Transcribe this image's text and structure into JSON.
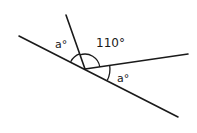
{
  "diagram": {
    "type": "angles-on-a-line",
    "labels": {
      "left_angle": "a°",
      "top_angle": "110°",
      "right_angle": "a°"
    },
    "colors": {
      "stroke": "#1a1a1a",
      "background": "#ffffff"
    },
    "geometry": {
      "vertex": [
        85,
        69
      ],
      "long_line": {
        "from": [
          19,
          36
        ],
        "to": [
          178,
          117
        ]
      },
      "steep_line": {
        "from": [
          85,
          69
        ],
        "to": [
          66,
          15
        ]
      },
      "right_line": {
        "from": [
          85,
          69
        ],
        "to": [
          188,
          54
        ]
      }
    }
  }
}
